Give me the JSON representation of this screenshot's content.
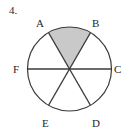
{
  "figure": {
    "number_label": "4.",
    "shape": "circle-with-three-diameters",
    "center": {
      "x": 69.5,
      "y": 69
    },
    "radius": 42,
    "outline_color": "#3a3a3a",
    "shaded_sector_color": "#c9c9c9",
    "background_color": "#ffffff",
    "shaded_sector": {
      "name": "sector-AB",
      "from_point": "A",
      "to_point": "B",
      "label": "shaded region AOB"
    },
    "diameters": [
      {
        "name": "diameter-AD",
        "endpoints": [
          "A",
          "D"
        ]
      },
      {
        "name": "diameter-BE",
        "endpoints": [
          "B",
          "E"
        ]
      },
      {
        "name": "diameter-FC",
        "endpoints": [
          "F",
          "C"
        ]
      }
    ],
    "points": [
      {
        "id": "A",
        "label": "A",
        "angle_deg": 120,
        "x": 48.5,
        "y": 32.6
      },
      {
        "id": "B",
        "label": "B",
        "angle_deg": 60,
        "x": 90.5,
        "y": 32.6
      },
      {
        "id": "C",
        "label": "C",
        "angle_deg": 0,
        "x": 111.5,
        "y": 69
      },
      {
        "id": "D",
        "label": "D",
        "angle_deg": 300,
        "x": 90.5,
        "y": 105.4
      },
      {
        "id": "E",
        "label": "E",
        "angle_deg": 240,
        "x": 48.5,
        "y": 105.4
      },
      {
        "id": "F",
        "label": "F",
        "angle_deg": 180,
        "x": 27.5,
        "y": 69
      }
    ]
  }
}
